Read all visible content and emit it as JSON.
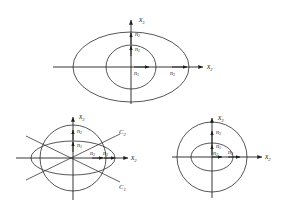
{
  "figure": {
    "background_color": "#ffffff",
    "line_color": "#2b2b2b",
    "panels": [
      {
        "id": "top",
        "name": "top-panel",
        "description": "Two concentric ellipses centered at origin",
        "origin": {
          "x": 131,
          "y": 67
        },
        "axes": [
          {
            "name": "vertical-axis",
            "label": "x",
            "subscript": "3",
            "direction": "up"
          },
          {
            "name": "horizontal-axis",
            "label": "x",
            "subscript": "2",
            "direction": "right"
          }
        ],
        "conics": [
          {
            "name": "outer-ellipse",
            "rx": 58,
            "ry": 35
          },
          {
            "name": "inner-ellipse",
            "rx": 25,
            "ry": 22
          }
        ],
        "vectors": [
          {
            "name": "n2-vertical",
            "label": "n",
            "subscript": "2",
            "direction": "up",
            "length": 11
          },
          {
            "name": "n1-vertical",
            "label": "n",
            "subscript": "1",
            "direction": "up",
            "length": 10
          },
          {
            "name": "n1-horizontal",
            "label": "n",
            "subscript": "1",
            "direction": "right",
            "length": 11
          },
          {
            "name": "n3-horizontal",
            "label": "n",
            "subscript": "3",
            "direction": "right",
            "length": 12
          }
        ]
      },
      {
        "id": "bottom-left",
        "name": "bottom-left-panel",
        "description": "Circle, flat ellipse and two crossing asymptote lines labeled C1 and C2",
        "origin": {
          "x": 73,
          "y": 158
        },
        "axes": [
          {
            "name": "vertical-axis",
            "label": "x",
            "subscript": "3",
            "direction": "up"
          },
          {
            "name": "horizontal-axis",
            "label": "x",
            "subscript": "2",
            "direction": "right"
          }
        ],
        "conics": [
          {
            "name": "outer-circle",
            "rx": 33,
            "ry": 33
          },
          {
            "name": "flat-ellipse",
            "rx": 42,
            "ry": 17
          }
        ],
        "lines": [
          {
            "name": "line-c2",
            "label": "C",
            "subscript": "2",
            "slope": "up-right"
          },
          {
            "name": "line-c1",
            "label": "C",
            "subscript": "1",
            "slope": "down-right"
          }
        ],
        "vectors": [
          {
            "name": "n2-vertical",
            "label": "n",
            "subscript": "2",
            "direction": "up",
            "length": 10
          },
          {
            "name": "n1-vertical",
            "label": "n",
            "subscript": "1",
            "direction": "up",
            "length": 10
          },
          {
            "name": "n2-horizontal",
            "label": "n",
            "subscript": "2",
            "direction": "right",
            "length": 10
          },
          {
            "name": "n3-horizontal",
            "label": "n",
            "subscript": "3",
            "direction": "right",
            "length": 10
          }
        ]
      },
      {
        "id": "bottom-right",
        "name": "bottom-right-panel",
        "description": "Large circle with smaller inner ellipse centered at origin",
        "origin": {
          "x": 212,
          "y": 157
        },
        "axes": [
          {
            "name": "vertical-axis",
            "label": "x",
            "subscript": "3",
            "direction": "up"
          },
          {
            "name": "horizontal-axis",
            "label": "x",
            "subscript": "2",
            "direction": "right"
          }
        ],
        "conics": [
          {
            "name": "outer-circle",
            "rx": 35,
            "ry": 35
          },
          {
            "name": "inner-ellipse",
            "rx": 21,
            "ry": 14
          }
        ],
        "vectors": [
          {
            "name": "n3-vertical",
            "label": "n",
            "subscript": "3",
            "direction": "up",
            "length": 13
          },
          {
            "name": "n1-vertical",
            "label": "n",
            "subscript": "1",
            "direction": "up",
            "length": 11
          },
          {
            "name": "n2-horizontal",
            "label": "n",
            "subscript": "2",
            "direction": "right",
            "length": 9
          },
          {
            "name": "n3-horizontal",
            "label": "n",
            "subscript": "3",
            "direction": "right",
            "length": 10
          }
        ]
      }
    ],
    "labels": {
      "x2": "x",
      "x3": "x",
      "n": "n",
      "c": "C",
      "sub_1": "1",
      "sub_2": "2",
      "sub_3": "3"
    }
  }
}
